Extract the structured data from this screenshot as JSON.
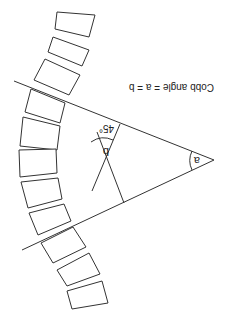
{
  "diagram": {
    "title": "Cobb angle = a = b",
    "angle_a_label": "a",
    "angle_b_label": "b",
    "perpendicular_label": "45°",
    "orientation": "rotated 180 degrees",
    "vertebrae_count": 12
  }
}
